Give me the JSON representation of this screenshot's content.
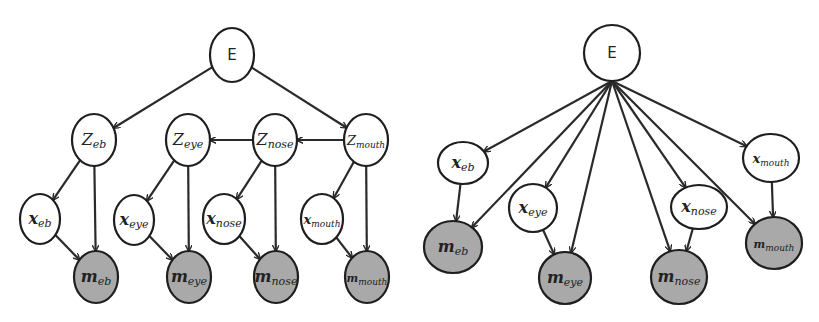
{
  "diagram": {
    "type": "graphical-model-pair",
    "colors": {
      "observed_fill": "#a9a9a9",
      "latent_fill": "#ffffff",
      "stroke": "#1e1e1e"
    },
    "left": {
      "name": "hierarchical-model",
      "nodes": [
        {
          "id": "E",
          "main": "E",
          "sub": "",
          "cx": 232,
          "cy": 55,
          "rx": 22,
          "ry": 27,
          "observed": false
        },
        {
          "id": "Z_eb",
          "main": "Z",
          "sub": "eb",
          "cx": 94,
          "cy": 140,
          "rx": 22,
          "ry": 26,
          "observed": false
        },
        {
          "id": "Z_eye",
          "main": "Z",
          "sub": "eye",
          "cx": 188,
          "cy": 140,
          "rx": 22,
          "ry": 26,
          "observed": false
        },
        {
          "id": "Z_nose",
          "main": "Z",
          "sub": "nose",
          "cx": 275,
          "cy": 140,
          "rx": 22,
          "ry": 26,
          "observed": false
        },
        {
          "id": "Z_mouth",
          "main": "Z",
          "sub": "mouth",
          "cx": 366,
          "cy": 140,
          "rx": 22,
          "ry": 26,
          "observed": false
        },
        {
          "id": "x_eb",
          "main": "x",
          "sub": "eb",
          "cx": 40,
          "cy": 219,
          "rx": 20,
          "ry": 25,
          "observed": false
        },
        {
          "id": "x_eye",
          "main": "x",
          "sub": "eye",
          "cx": 134,
          "cy": 220,
          "rx": 20,
          "ry": 25,
          "observed": false
        },
        {
          "id": "x_nose",
          "main": "x",
          "sub": "nose",
          "cx": 224,
          "cy": 219,
          "rx": 21,
          "ry": 25,
          "observed": false
        },
        {
          "id": "x_mouth",
          "main": "x",
          "sub": "mouth",
          "cx": 322,
          "cy": 219,
          "rx": 21,
          "ry": 25,
          "observed": false
        },
        {
          "id": "m_eb",
          "main": "m",
          "sub": "eb",
          "cx": 96,
          "cy": 277,
          "rx": 22,
          "ry": 26,
          "observed": true
        },
        {
          "id": "m_eye",
          "main": "m",
          "sub": "eye",
          "cx": 189,
          "cy": 277,
          "rx": 22,
          "ry": 26,
          "observed": true
        },
        {
          "id": "m_nose",
          "main": "m",
          "sub": "nose",
          "cx": 276,
          "cy": 277,
          "rx": 22,
          "ry": 26,
          "observed": true
        },
        {
          "id": "m_mouth",
          "main": "m",
          "sub": "mouth",
          "cx": 367,
          "cy": 277,
          "rx": 22,
          "ry": 26,
          "observed": true
        }
      ],
      "edges": [
        [
          "E",
          "Z_eb"
        ],
        [
          "E",
          "Z_mouth"
        ],
        [
          "Z_nose",
          "Z_eye"
        ],
        [
          "Z_mouth",
          "Z_nose"
        ],
        [
          "Z_eb",
          "x_eb"
        ],
        [
          "Z_eb",
          "m_eb"
        ],
        [
          "x_eb",
          "m_eb"
        ],
        [
          "Z_eye",
          "x_eye"
        ],
        [
          "Z_eye",
          "m_eye"
        ],
        [
          "x_eye",
          "m_eye"
        ],
        [
          "Z_nose",
          "x_nose"
        ],
        [
          "Z_nose",
          "m_nose"
        ],
        [
          "x_nose",
          "m_nose"
        ],
        [
          "Z_mouth",
          "x_mouth"
        ],
        [
          "Z_mouth",
          "m_mouth"
        ],
        [
          "x_mouth",
          "m_mouth"
        ]
      ]
    },
    "right": {
      "name": "flat-model",
      "nodes": [
        {
          "id": "E",
          "main": "E",
          "sub": "",
          "cx": 612,
          "cy": 53,
          "rx": 28,
          "ry": 28,
          "observed": false
        },
        {
          "id": "x_eb",
          "main": "x",
          "sub": "eb",
          "cx": 463,
          "cy": 163,
          "rx": 25,
          "ry": 21,
          "observed": false
        },
        {
          "id": "x_eye",
          "main": "x",
          "sub": "eye",
          "cx": 533,
          "cy": 208,
          "rx": 24,
          "ry": 24,
          "observed": false
        },
        {
          "id": "x_nose",
          "main": "x",
          "sub": "nose",
          "cx": 699,
          "cy": 207,
          "rx": 28,
          "ry": 22,
          "observed": false
        },
        {
          "id": "x_mouth",
          "main": "x",
          "sub": "mouth",
          "cx": 771,
          "cy": 158,
          "rx": 28,
          "ry": 24,
          "observed": false
        },
        {
          "id": "m_eb",
          "main": "m",
          "sub": "eb",
          "cx": 453,
          "cy": 247,
          "rx": 29,
          "ry": 26,
          "observed": true
        },
        {
          "id": "m_eye",
          "main": "m",
          "sub": "eye",
          "cx": 565,
          "cy": 278,
          "rx": 26,
          "ry": 26,
          "observed": true
        },
        {
          "id": "m_nose",
          "main": "m",
          "sub": "nose",
          "cx": 679,
          "cy": 277,
          "rx": 28,
          "ry": 27,
          "observed": true
        },
        {
          "id": "m_mouth",
          "main": "m",
          "sub": "mouth",
          "cx": 774,
          "cy": 243,
          "rx": 28,
          "ry": 26,
          "observed": true
        }
      ],
      "edges": [
        [
          "E",
          "x_eb"
        ],
        [
          "E",
          "x_eye"
        ],
        [
          "E",
          "x_nose"
        ],
        [
          "E",
          "x_mouth"
        ],
        [
          "E",
          "m_eb"
        ],
        [
          "E",
          "m_eye"
        ],
        [
          "E",
          "m_nose"
        ],
        [
          "E",
          "m_mouth"
        ],
        [
          "x_eb",
          "m_eb"
        ],
        [
          "x_eye",
          "m_eye"
        ],
        [
          "x_nose",
          "m_nose"
        ],
        [
          "x_mouth",
          "m_mouth"
        ]
      ]
    }
  }
}
